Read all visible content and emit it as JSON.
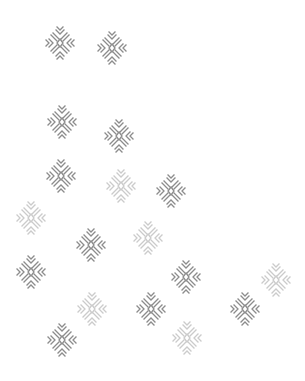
{
  "canvas": {
    "width": 305,
    "height": 381,
    "background": "#ffffff"
  },
  "icon": {
    "name": "snowflake-icon",
    "dark_color": "#8c8c8c",
    "light_color": "#cbcbcb"
  },
  "flakes": [
    {
      "x": 60,
      "y": 43,
      "tone": "dark"
    },
    {
      "x": 112,
      "y": 48,
      "tone": "dark"
    },
    {
      "x": 62,
      "y": 122,
      "tone": "dark"
    },
    {
      "x": 119,
      "y": 136,
      "tone": "dark"
    },
    {
      "x": 61,
      "y": 176,
      "tone": "dark"
    },
    {
      "x": 121,
      "y": 186,
      "tone": "light"
    },
    {
      "x": 171,
      "y": 191,
      "tone": "dark"
    },
    {
      "x": 31,
      "y": 218,
      "tone": "light"
    },
    {
      "x": 91,
      "y": 245,
      "tone": "dark"
    },
    {
      "x": 148,
      "y": 238,
      "tone": "light"
    },
    {
      "x": 31,
      "y": 272,
      "tone": "dark"
    },
    {
      "x": 186,
      "y": 277,
      "tone": "dark"
    },
    {
      "x": 276,
      "y": 280,
      "tone": "light"
    },
    {
      "x": 92,
      "y": 309,
      "tone": "light"
    },
    {
      "x": 151,
      "y": 309,
      "tone": "dark"
    },
    {
      "x": 245,
      "y": 309,
      "tone": "dark"
    },
    {
      "x": 187,
      "y": 338,
      "tone": "light"
    },
    {
      "x": 62,
      "y": 340,
      "tone": "dark"
    }
  ]
}
